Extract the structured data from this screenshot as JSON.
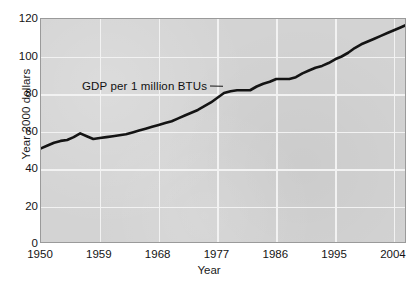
{
  "chart_data": {
    "type": "line",
    "title": "",
    "xlabel": "Year",
    "ylabel": "Year 2000 dollars",
    "xlim": [
      1950,
      2006
    ],
    "ylim": [
      0,
      120
    ],
    "grid": true,
    "legend_position": "none",
    "xticks": [
      "1950",
      "1959",
      "1968",
      "1977",
      "1986",
      "1995",
      "2004"
    ],
    "xtick_values": [
      1950,
      1959,
      1968,
      1977,
      1986,
      1995,
      2004
    ],
    "yticks": [
      "0",
      "20",
      "40",
      "60",
      "80",
      "100",
      "120"
    ],
    "ytick_values": [
      0,
      20,
      40,
      60,
      80,
      100,
      120
    ],
    "annotations": [
      {
        "text": "GDP per 1 million BTUs",
        "x": 1967,
        "y": 90,
        "leader_to": {
          "x": 1978,
          "y": 82
        }
      }
    ],
    "series": [
      {
        "name": "GDP per 1 million BTUs",
        "color": "#141414",
        "line_width": 2.6,
        "x": [
          1950,
          1951,
          1952,
          1953,
          1954,
          1955,
          1956,
          1957,
          1958,
          1959,
          1960,
          1961,
          1962,
          1963,
          1964,
          1965,
          1966,
          1967,
          1968,
          1969,
          1970,
          1971,
          1972,
          1973,
          1974,
          1975,
          1976,
          1977,
          1978,
          1979,
          1980,
          1981,
          1982,
          1983,
          1984,
          1985,
          1986,
          1987,
          1988,
          1989,
          1990,
          1991,
          1992,
          1993,
          1994,
          1995,
          1996,
          1997,
          1998,
          1999,
          2000,
          2001,
          2002,
          2003,
          2004,
          2005,
          2006
        ],
        "values": [
          51.0,
          52.5,
          54.0,
          55.0,
          55.5,
          57.0,
          59.0,
          57.5,
          56.0,
          56.5,
          57.0,
          57.5,
          58.0,
          58.5,
          59.5,
          60.5,
          61.5,
          62.5,
          63.5,
          64.5,
          65.5,
          67.0,
          68.5,
          70.0,
          71.5,
          73.5,
          75.5,
          78.0,
          80.5,
          81.5,
          82.0,
          82.0,
          82.0,
          84.0,
          85.5,
          86.5,
          88.0,
          88.0,
          88.0,
          89.0,
          91.0,
          92.5,
          94.0,
          95.0,
          96.5,
          98.5,
          100.0,
          102.0,
          104.5,
          106.5,
          108.0,
          109.5,
          111.0,
          112.5,
          114.0,
          115.5,
          117.0
        ]
      }
    ]
  }
}
